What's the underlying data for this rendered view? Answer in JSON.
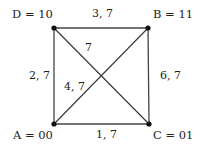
{
  "diagram": {
    "type": "graph",
    "vertices": [
      {
        "id": "D",
        "label": "D = 10",
        "x": 54,
        "y": 28
      },
      {
        "id": "B",
        "label": "B = 11",
        "x": 148,
        "y": 28
      },
      {
        "id": "A",
        "label": "A = 00",
        "x": 54,
        "y": 124
      },
      {
        "id": "C",
        "label": "C = 01",
        "x": 149,
        "y": 124
      }
    ],
    "edges": [
      {
        "from": "D",
        "to": "B",
        "label": "3, 7"
      },
      {
        "from": "D",
        "to": "A",
        "label": "2, 7"
      },
      {
        "from": "B",
        "to": "C",
        "label": "6, 7"
      },
      {
        "from": "A",
        "to": "C",
        "label": "1, 7"
      },
      {
        "from": "D",
        "to": "C",
        "label": "7"
      },
      {
        "from": "A",
        "to": "B",
        "label": "4, 7"
      }
    ],
    "colors": {
      "line": "#333333",
      "node": "#111111",
      "text": "#222222",
      "background": "#ffffff"
    }
  }
}
